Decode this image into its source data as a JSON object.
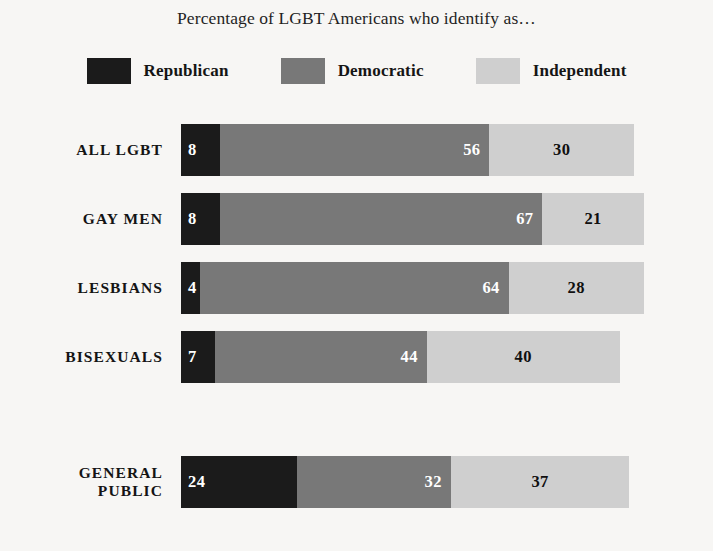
{
  "title": "Percentage of LGBT Americans who identify as…",
  "legend": [
    {
      "label": "Republican",
      "color": "#1b1b1b",
      "key": "republican"
    },
    {
      "label": "Democratic",
      "color": "#787878",
      "key": "democratic"
    },
    {
      "label": "Independent",
      "color": "#cfcfcf",
      "key": "independent"
    }
  ],
  "rows": [
    {
      "label": "ALL LGBT",
      "values": {
        "republican": "8",
        "democratic": "56",
        "independent": "30"
      }
    },
    {
      "label": "GAY MEN",
      "values": {
        "republican": "8",
        "democratic": "67",
        "independent": "21"
      }
    },
    {
      "label": "LESBIANS",
      "values": {
        "republican": "4",
        "democratic": "64",
        "independent": "28"
      }
    },
    {
      "label": "BISEXUALS",
      "values": {
        "republican": "7",
        "democratic": "44",
        "independent": "40"
      }
    },
    {
      "label": "GENERAL PUBLIC",
      "values": {
        "republican": "24",
        "democratic": "32",
        "independent": "37"
      }
    }
  ],
  "chart_data": {
    "type": "bar",
    "title": "Percentage of LGBT Americans who identify as…",
    "xlabel": "",
    "ylabel": "",
    "orientation": "horizontal",
    "stacked": true,
    "grid": false,
    "legend_position": "top-center",
    "categories": [
      "ALL LGBT",
      "GAY MEN",
      "LESBIANS",
      "BISEXUALS",
      "GENERAL PUBLIC"
    ],
    "series": [
      {
        "name": "Republican",
        "color": "#1b1b1b",
        "values": [
          8,
          8,
          4,
          7,
          24
        ]
      },
      {
        "name": "Democratic",
        "color": "#787878",
        "values": [
          56,
          67,
          64,
          44,
          32
        ]
      },
      {
        "name": "Independent",
        "color": "#cfcfcf",
        "values": [
          30,
          21,
          28,
          40,
          37
        ]
      }
    ],
    "row_totals": [
      94,
      96,
      96,
      91,
      93
    ],
    "units": "percent",
    "xlim": [
      0,
      96
    ]
  },
  "layout": {
    "scale_px_per_unit": 4.82,
    "bar_left_px": 181,
    "bar_height_px": 52,
    "row_tops_px": [
      6,
      75,
      144,
      213,
      338
    ]
  }
}
